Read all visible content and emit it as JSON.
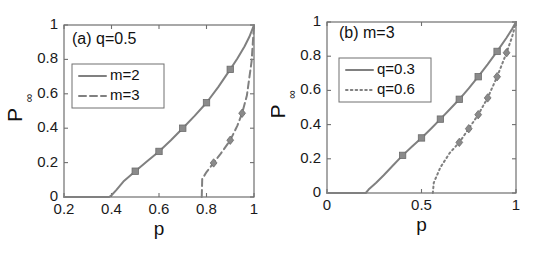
{
  "figure": {
    "background": "#ffffff",
    "curve_color": "#808080",
    "marker_color": "#8a8a8a",
    "axis_color": "#6f6f6f",
    "text_color": "#111111"
  },
  "chart_data": [
    {
      "type": "line",
      "panel_id": "a",
      "title": "(a) q=0.5",
      "xlabel": "p",
      "ylabel": "P",
      "ylabel_sub": "∞",
      "xlim": [
        0.2,
        1
      ],
      "ylim": [
        0,
        1
      ],
      "xticks": [
        0.2,
        0.4,
        0.6,
        0.8,
        1
      ],
      "xticklabels": [
        "0.2",
        "0.4",
        "0.6",
        "0.8",
        "1"
      ],
      "yticks": [
        0,
        0.2,
        0.4,
        0.6,
        0.8,
        1
      ],
      "yticklabels": [
        "0",
        "0.2",
        "0.4",
        "0.6",
        "0.8",
        "1"
      ],
      "grid": false,
      "legend_position": "upper-left",
      "series": [
        {
          "name": "m=2",
          "linestyle": "solid",
          "marker": "square",
          "x": [
            0.2,
            0.3,
            0.39,
            0.4,
            0.42,
            0.45,
            0.5,
            0.55,
            0.6,
            0.65,
            0.7,
            0.75,
            0.8,
            0.85,
            0.9,
            0.93,
            0.96,
            0.98,
            1.0
          ],
          "y": [
            0.0,
            0.0,
            0.0,
            0.01,
            0.04,
            0.09,
            0.15,
            0.208,
            0.265,
            0.33,
            0.4,
            0.472,
            0.548,
            0.64,
            0.742,
            0.805,
            0.875,
            0.93,
            1.0
          ],
          "marker_x": [
            0.5,
            0.6,
            0.7,
            0.8,
            0.9
          ],
          "marker_y": [
            0.15,
            0.265,
            0.4,
            0.548,
            0.742
          ]
        },
        {
          "name": "m=3",
          "linestyle": "dashed",
          "marker": "diamond",
          "x": [
            0.78,
            0.782,
            0.8,
            0.83,
            0.86,
            0.9,
            0.93,
            0.95,
            0.97,
            0.99,
            1.0
          ],
          "y": [
            0.0,
            0.105,
            0.145,
            0.198,
            0.252,
            0.33,
            0.415,
            0.487,
            0.59,
            0.79,
            1.0
          ],
          "marker_x": [
            0.83,
            0.9,
            0.95
          ],
          "marker_y": [
            0.198,
            0.33,
            0.487
          ]
        }
      ]
    },
    {
      "type": "line",
      "panel_id": "b",
      "title": "(b) m=3",
      "xlabel": "p",
      "ylabel": "P",
      "ylabel_sub": "∞",
      "xlim": [
        0,
        1
      ],
      "ylim": [
        0,
        1
      ],
      "xticks": [
        0,
        0.5,
        1
      ],
      "xticklabels": [
        "0",
        "0.5",
        "1"
      ],
      "yticks": [
        0,
        0.2,
        0.4,
        0.6,
        0.8,
        1
      ],
      "yticklabels": [
        "0",
        "0.2",
        "0.4",
        "0.6",
        "0.8",
        "1"
      ],
      "grid": false,
      "legend_position": "upper-left",
      "series": [
        {
          "name": "q=0.3",
          "linestyle": "solid",
          "marker": "square",
          "x": [
            0.0,
            0.1,
            0.205,
            0.22,
            0.26,
            0.3,
            0.35,
            0.4,
            0.45,
            0.5,
            0.55,
            0.6,
            0.65,
            0.7,
            0.75,
            0.8,
            0.85,
            0.9,
            0.95,
            0.98,
            1.0
          ],
          "y": [
            0.0,
            0.0,
            0.0,
            0.02,
            0.06,
            0.104,
            0.162,
            0.22,
            0.272,
            0.322,
            0.376,
            0.432,
            0.49,
            0.548,
            0.612,
            0.68,
            0.752,
            0.828,
            0.908,
            0.96,
            1.0
          ],
          "marker_x": [
            0.4,
            0.5,
            0.6,
            0.7,
            0.8,
            0.9
          ],
          "marker_y": [
            0.22,
            0.322,
            0.432,
            0.548,
            0.68,
            0.828
          ]
        },
        {
          "name": "q=0.6",
          "linestyle": "dotted",
          "marker": "diamond",
          "x": [
            0.56,
            0.565,
            0.6,
            0.65,
            0.7,
            0.75,
            0.8,
            0.85,
            0.9,
            0.95,
            0.98,
            1.0
          ],
          "y": [
            0.0,
            0.06,
            0.15,
            0.235,
            0.296,
            0.376,
            0.458,
            0.556,
            0.68,
            0.82,
            0.915,
            1.0
          ],
          "marker_x": [
            0.7,
            0.75,
            0.8,
            0.85,
            0.9,
            0.95
          ],
          "marker_y": [
            0.296,
            0.376,
            0.458,
            0.556,
            0.68,
            0.82
          ]
        }
      ]
    }
  ]
}
